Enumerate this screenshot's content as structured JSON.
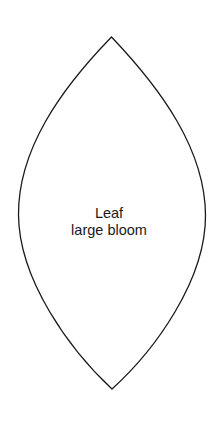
{
  "diagram": {
    "type": "template-shape",
    "shape": "leaf",
    "label": {
      "line1": "Leaf",
      "line2": "large bloom"
    },
    "colors": {
      "background": "#ffffff",
      "outline": "#1a1a1a",
      "text": "#1a1a1a"
    }
  }
}
